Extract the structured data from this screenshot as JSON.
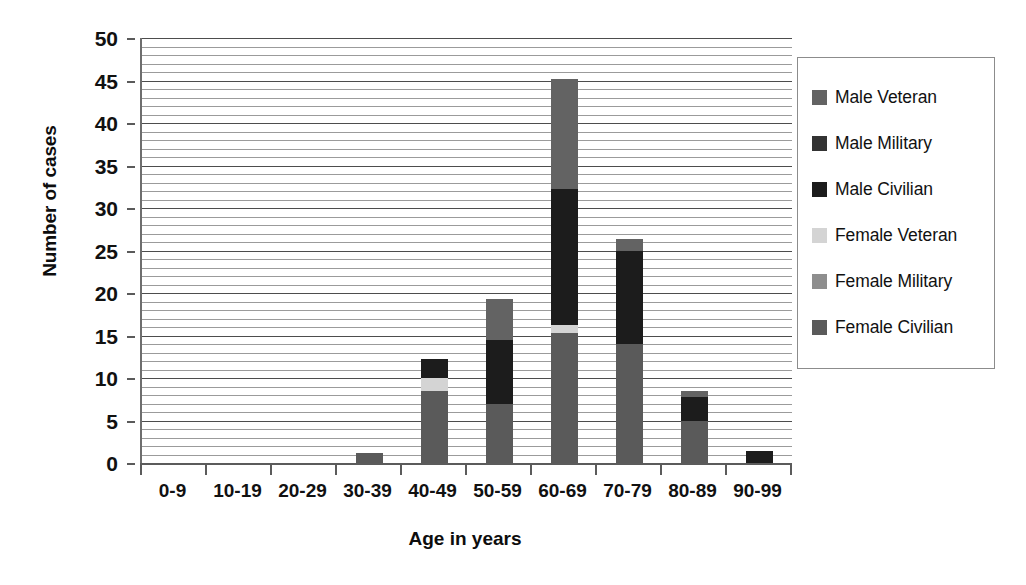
{
  "chart_data": {
    "type": "bar",
    "subtype": "stacked",
    "title": "",
    "xlabel": "Age in years",
    "ylabel": "Number of cases",
    "categories": [
      "0-9",
      "10-19",
      "20-29",
      "30-39",
      "40-49",
      "50-59",
      "60-69",
      "70-79",
      "80-89",
      "90-99"
    ],
    "ylim": [
      0,
      50
    ],
    "yticks": [
      0,
      5,
      10,
      15,
      20,
      25,
      30,
      35,
      40,
      45,
      50
    ],
    "ytick_labels": [
      "0",
      "5",
      "10",
      "15",
      "20",
      "25",
      "30",
      "35",
      "40",
      "45",
      "50"
    ],
    "minor_gridline_step": 1,
    "grid": true,
    "legend_position": "right",
    "series": [
      {
        "name": "Female Civilian",
        "color": "#5a5a5a",
        "values": [
          0,
          0,
          0,
          1.2,
          8.5,
          7.0,
          15.3,
          14.0,
          5.0,
          0
        ]
      },
      {
        "name": "Female Military",
        "color": "#8e8e8e",
        "values": [
          0,
          0,
          0,
          0,
          0,
          0,
          0,
          0,
          0,
          0
        ]
      },
      {
        "name": "Female Veteran",
        "color": "#d4d4d4",
        "values": [
          0,
          0,
          0,
          0,
          1.5,
          0,
          0.9,
          0,
          0,
          0
        ]
      },
      {
        "name": "Male Civilian",
        "color": "#1c1c1c",
        "values": [
          0,
          0,
          0,
          0,
          2.2,
          7.5,
          16.0,
          11.0,
          2.8,
          1.4
        ]
      },
      {
        "name": "Male Military",
        "color": "#333333",
        "values": [
          0,
          0,
          0,
          0,
          0,
          0,
          0,
          0,
          0,
          0
        ]
      },
      {
        "name": "Male Veteran",
        "color": "#636363",
        "values": [
          0,
          0,
          0,
          0,
          0,
          4.8,
          13.0,
          1.3,
          0.7,
          0
        ]
      }
    ],
    "totals": [
      0,
      0,
      0,
      1.2,
      12.2,
      19.3,
      45.2,
      26.3,
      8.5,
      1.4
    ]
  },
  "legend": {
    "items": [
      {
        "label": "Male Veteran",
        "color": "#636363"
      },
      {
        "label": "Male Military",
        "color": "#333333"
      },
      {
        "label": "Male Civilian",
        "color": "#1c1c1c"
      },
      {
        "label": "Female Veteran",
        "color": "#d4d4d4"
      },
      {
        "label": "Female Military",
        "color": "#8e8e8e"
      },
      {
        "label": "Female Civilian",
        "color": "#5a5a5a"
      }
    ]
  },
  "axes": {
    "y_title": "Number of cases",
    "x_title": "Age in years"
  }
}
